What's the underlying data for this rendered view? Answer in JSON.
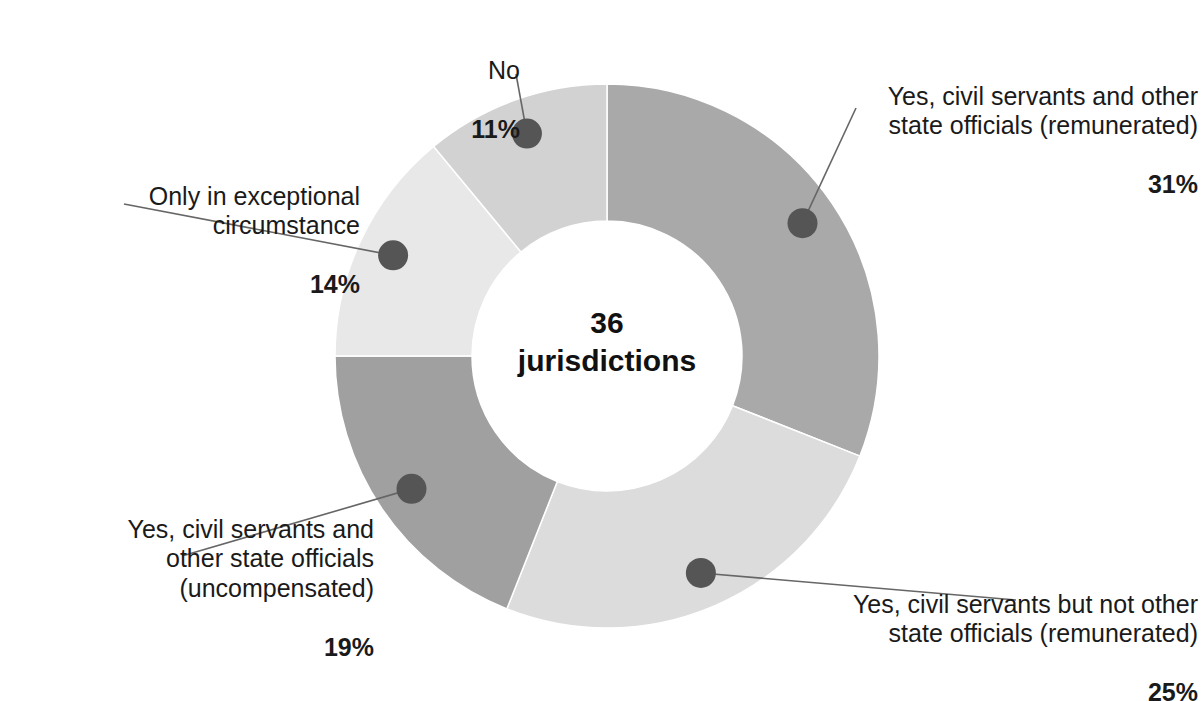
{
  "chart_data": {
    "type": "pie",
    "variant": "donut",
    "title": "",
    "center_label_top": "36",
    "center_label_bottom": "jurisdictions",
    "total": 36,
    "total_unit": "jurisdictions",
    "start_angle_deg": 0,
    "direction": "clockwise",
    "legend_position": "callout-labels",
    "categories": [
      "Yes, civil servants and other state officials (remunerated)",
      "Yes, civil servants but not other state officials (remunerated)",
      "Yes, civil servants and other state officials (uncompensated)",
      "Only in exceptional circumstance",
      "No"
    ],
    "values": [
      31,
      25,
      19,
      14,
      11
    ],
    "value_labels": [
      "31%",
      "25%",
      "19%",
      "14%",
      "11%"
    ],
    "colors": [
      "#a9a9a9",
      "#dcdcdc",
      "#a0a0a0",
      "#e8e8e8",
      "#d2d2d2"
    ],
    "slices": [
      {
        "label_line1": "Yes, civil servants and other",
        "label_line2": "state officials (remunerated)",
        "percent_text": "31%",
        "value": 31,
        "color": "#a9a9a9"
      },
      {
        "label_line1": "Yes, civil servants but not other",
        "label_line2": "state officials (remunerated)",
        "percent_text": "25%",
        "value": 25,
        "color": "#dcdcdc"
      },
      {
        "label_line1": "Yes, civil servants and",
        "label_line2": "other state officials",
        "label_line3": "(uncompensated)",
        "percent_text": "19%",
        "value": 19,
        "color": "#a0a0a0"
      },
      {
        "label_line1": "Only in exceptional",
        "label_line2": "circumstance",
        "percent_text": "14%",
        "value": 14,
        "color": "#e8e8e8"
      },
      {
        "label_line1": "No",
        "percent_text": "11%",
        "value": 11,
        "color": "#d2d2d2"
      }
    ]
  },
  "labels": {
    "no": {
      "text": "No",
      "pct": "11%"
    },
    "yes_remunerated_all": {
      "text": "Yes, civil servants and other\nstate officials (remunerated)",
      "pct": "31%"
    },
    "only_exceptional": {
      "text": "Only in exceptional\ncircumstance",
      "pct": "14%"
    },
    "yes_uncompensated": {
      "text": "Yes, civil servants and\nother state officials\n(uncompensated)",
      "pct": "19%"
    },
    "yes_remunerated_civil_only": {
      "text": "Yes, civil servants but not other\nstate officials (remunerated)",
      "pct": "25%"
    }
  },
  "center": {
    "number": "36",
    "unit": "jurisdictions"
  },
  "style": {
    "marker_color": "#555555",
    "leader_color": "#666666",
    "text_color": "#1a1a1a",
    "background": "#ffffff"
  }
}
